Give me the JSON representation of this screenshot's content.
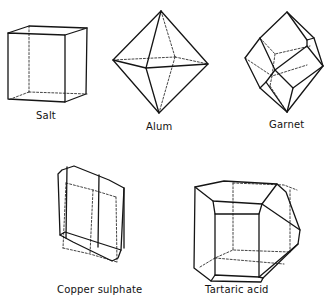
{
  "figure": {
    "crystals": [
      {
        "name": "Salt",
        "shape": "cube"
      },
      {
        "name": "Alum",
        "shape": "octahedron"
      },
      {
        "name": "Garnet",
        "shape": "rhombic dodecahedron"
      },
      {
        "name": "Copper sulphate",
        "shape": "triclinic prism"
      },
      {
        "name": "Tartaric acid",
        "shape": "monoclinic crystal"
      }
    ]
  },
  "colors": {
    "line": "#151515",
    "background": "#ffffff"
  }
}
